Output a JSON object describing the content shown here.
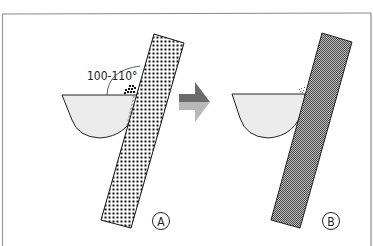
{
  "figure": {
    "angle_label": "100-110°",
    "panel_a_label": "A",
    "panel_b_label": "B",
    "colors": {
      "frame": "#777777",
      "outline": "#222222",
      "bowl_fill": "#ececec",
      "coarse_dots": "#111111",
      "fine_hatch": "#555555",
      "arrow_dark": "#6b6b6b",
      "arrow_light": "#b8b8b8"
    },
    "panels": [
      {
        "id": "A",
        "strip_pattern": "coarse-dot",
        "debris": "dotted-cluster",
        "angle_annotation": "100-110°"
      },
      {
        "id": "B",
        "strip_pattern": "fine-crosshatch",
        "debris": "small-flecks"
      }
    ],
    "arrow_direction": "right"
  }
}
